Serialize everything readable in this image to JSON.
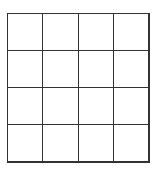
{
  "grid": {
    "rows": 4,
    "columns": 4,
    "line_color": "#333333",
    "background_color": "#ffffff",
    "cells": [
      [
        "",
        "",
        "",
        ""
      ],
      [
        "",
        "",
        "",
        ""
      ],
      [
        "",
        "",
        "",
        ""
      ],
      [
        "",
        "",
        "",
        ""
      ]
    ]
  }
}
